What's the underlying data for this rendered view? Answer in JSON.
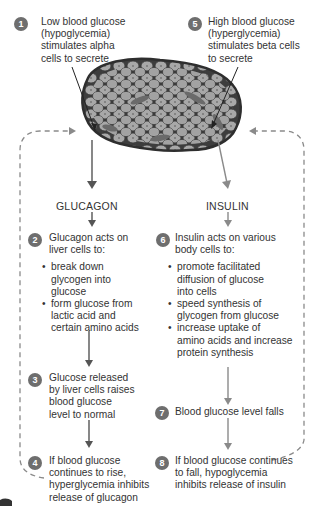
{
  "diagram": {
    "colors": {
      "badge": "#6e6e6e",
      "glucagon_arrow": "#555555",
      "insulin_arrow": "#8a8a8a",
      "feedback_dash": "#8a8a8a",
      "islet_cell": "#a9a9a9",
      "islet_border": "#3a3a3a"
    },
    "islet": {
      "label": "pancreatic islet",
      "icon": "islet-cells-illustration"
    },
    "steps": [
      {
        "num": "1",
        "text": "Low blood glucose (hypoglycemia) stimulates alpha cells to secrete",
        "lines": [
          "Low blood glucose",
          "(hypoglycemia)",
          "stimulates alpha",
          "cells to secrete"
        ]
      },
      {
        "num": "2",
        "lines": [
          "Glucagon acts on",
          "liver cells to:"
        ],
        "bullets": [
          {
            "lines": [
              "break down",
              "glycogen into",
              "glucose"
            ]
          },
          {
            "lines": [
              "form glucose from",
              "lactic acid and",
              "certain amino acids"
            ]
          }
        ]
      },
      {
        "num": "3",
        "lines": [
          "Glucose released",
          "by liver cells raises",
          "blood glucose",
          "level to normal"
        ]
      },
      {
        "num": "4",
        "lines": [
          "If blood glucose",
          "continues to rise,",
          "hyperglycemia inhibits",
          "release of glucagon"
        ]
      },
      {
        "num": "5",
        "lines": [
          "High blood glucose",
          "(hyperglycemia)",
          "stimulates beta cells",
          "to secrete"
        ]
      },
      {
        "num": "6",
        "lines": [
          "Insulin acts on various",
          "body cells to:"
        ],
        "bullets": [
          {
            "lines": [
              "promote facilitated",
              "diffusion of glucose",
              "into cells"
            ]
          },
          {
            "lines": [
              "speed synthesis of",
              "glycogen from glucose"
            ]
          },
          {
            "lines": [
              "increase uptake of",
              "amino acids and increase",
              "protein synthesis"
            ]
          }
        ]
      },
      {
        "num": "7",
        "lines": [
          "Blood glucose level falls"
        ]
      },
      {
        "num": "8",
        "lines": [
          "If blood glucose continues",
          "to fall, hypoglycemia",
          "inhibits release of insulin"
        ]
      }
    ],
    "hormones": {
      "left": "GLUCAGON",
      "right": "INSULIN"
    }
  }
}
